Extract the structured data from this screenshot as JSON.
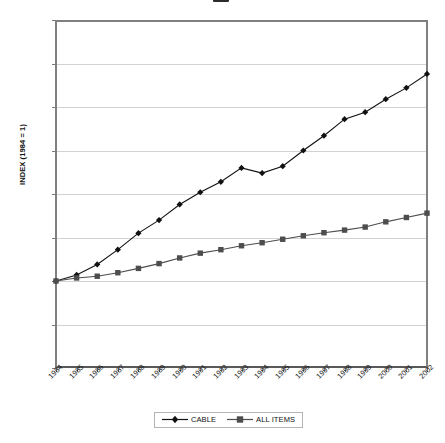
{
  "chart_data": {
    "type": "line",
    "title": "",
    "xlabel": "",
    "ylabel": "INDEX (1984 = 1)",
    "ylim": [
      0,
      4
    ],
    "yticks": [
      "0",
      "0.5",
      "1",
      "1.5",
      "2",
      "2.5",
      "3",
      "3.5",
      "4"
    ],
    "grid": true,
    "legend_position": "bottom",
    "categories": [
      "1984",
      "1985",
      "1986",
      "1987",
      "1988",
      "1989",
      "1990",
      "1991",
      "1992",
      "1993",
      "1994",
      "1995",
      "1996",
      "1997",
      "1998",
      "1999",
      "2000",
      "2001",
      "2002"
    ],
    "series": [
      {
        "name": "CABLE",
        "marker": "diamond",
        "color": "#111111",
        "values": [
          1.0,
          1.07,
          1.19,
          1.36,
          1.55,
          1.7,
          1.88,
          2.02,
          2.14,
          2.3,
          2.24,
          2.32,
          2.5,
          2.67,
          2.86,
          2.94,
          3.09,
          3.22,
          3.38
        ]
      },
      {
        "name": "ALL ITEMS",
        "marker": "square",
        "color": "#4d4d4d",
        "values": [
          1.0,
          1.035,
          1.055,
          1.095,
          1.145,
          1.2,
          1.265,
          1.32,
          1.36,
          1.405,
          1.44,
          1.48,
          1.52,
          1.555,
          1.585,
          1.62,
          1.68,
          1.73,
          1.78
        ]
      }
    ]
  },
  "legend": {
    "items": [
      {
        "label": "CABLE"
      },
      {
        "label": "ALL ITEMS"
      }
    ]
  },
  "axes": {
    "y_axis_title": "INDEX (1984 = 1)"
  }
}
